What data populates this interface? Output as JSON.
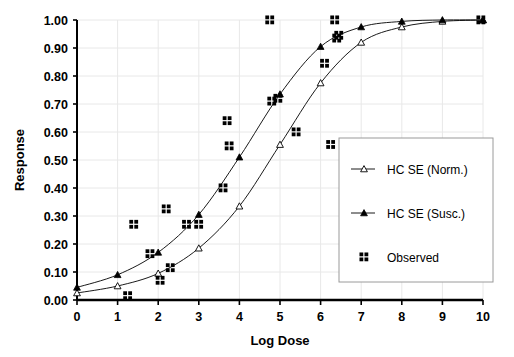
{
  "chart_data": {
    "type": "line",
    "title": "",
    "xlabel": "Log Dose",
    "ylabel": "Response",
    "xlim": [
      0,
      10
    ],
    "ylim": [
      0,
      1
    ],
    "xticks": [
      "0",
      "1",
      "2",
      "3",
      "4",
      "5",
      "6",
      "7",
      "8",
      "9",
      "10"
    ],
    "yticks": [
      "0.00",
      "0.10",
      "0.20",
      "0.30",
      "0.40",
      "0.50",
      "0.60",
      "0.70",
      "0.80",
      "0.90",
      "1.00"
    ],
    "grid": true,
    "legend_position": "right-lower",
    "series": [
      {
        "name": "HC SE (Norm.)",
        "marker": "open-triangle",
        "color": "#000000",
        "points": [
          {
            "x": 0.0,
            "y": 0.025
          },
          {
            "x": 1.0,
            "y": 0.05
          },
          {
            "x": 2.0,
            "y": 0.095
          },
          {
            "x": 3.0,
            "y": 0.185
          },
          {
            "x": 4.0,
            "y": 0.335
          },
          {
            "x": 5.0,
            "y": 0.555
          },
          {
            "x": 6.0,
            "y": 0.775
          },
          {
            "x": 7.0,
            "y": 0.92
          },
          {
            "x": 8.0,
            "y": 0.975
          },
          {
            "x": 9.0,
            "y": 0.995
          },
          {
            "x": 10.0,
            "y": 1.0
          }
        ]
      },
      {
        "name": "HC SE (Susc.)",
        "marker": "filled-triangle",
        "color": "#000000",
        "points": [
          {
            "x": 0.0,
            "y": 0.045
          },
          {
            "x": 1.0,
            "y": 0.09
          },
          {
            "x": 2.0,
            "y": 0.17
          },
          {
            "x": 3.0,
            "y": 0.305
          },
          {
            "x": 4.0,
            "y": 0.51
          },
          {
            "x": 5.0,
            "y": 0.735
          },
          {
            "x": 6.0,
            "y": 0.905
          },
          {
            "x": 7.0,
            "y": 0.975
          },
          {
            "x": 8.0,
            "y": 0.995
          },
          {
            "x": 9.0,
            "y": 1.0
          },
          {
            "x": 10.0,
            "y": 1.0
          }
        ]
      },
      {
        "name": "Observed",
        "marker": "filled-square-quad",
        "color": "#000000",
        "points": [
          {
            "x": 1.25,
            "y": 0.015
          },
          {
            "x": 1.4,
            "y": 0.27
          },
          {
            "x": 1.8,
            "y": 0.165
          },
          {
            "x": 2.05,
            "y": 0.07
          },
          {
            "x": 2.2,
            "y": 0.325
          },
          {
            "x": 2.3,
            "y": 0.115
          },
          {
            "x": 2.7,
            "y": 0.27
          },
          {
            "x": 3.0,
            "y": 0.27
          },
          {
            "x": 3.6,
            "y": 0.4
          },
          {
            "x": 3.7,
            "y": 0.64
          },
          {
            "x": 3.75,
            "y": 0.55
          },
          {
            "x": 4.75,
            "y": 1.0
          },
          {
            "x": 4.8,
            "y": 0.71
          },
          {
            "x": 4.95,
            "y": 0.72
          },
          {
            "x": 5.4,
            "y": 0.6
          },
          {
            "x": 6.1,
            "y": 0.845
          },
          {
            "x": 6.25,
            "y": 0.555
          },
          {
            "x": 6.35,
            "y": 1.0
          },
          {
            "x": 6.4,
            "y": 0.935
          },
          {
            "x": 6.45,
            "y": 0.945
          },
          {
            "x": 9.95,
            "y": 1.0
          }
        ]
      }
    ],
    "legend_entries": [
      {
        "label": "HC SE (Norm.)",
        "marker": "open-triangle"
      },
      {
        "label": "HC SE (Susc.)",
        "marker": "filled-triangle"
      },
      {
        "label": "Observed",
        "marker": "filled-square-quad"
      }
    ]
  }
}
